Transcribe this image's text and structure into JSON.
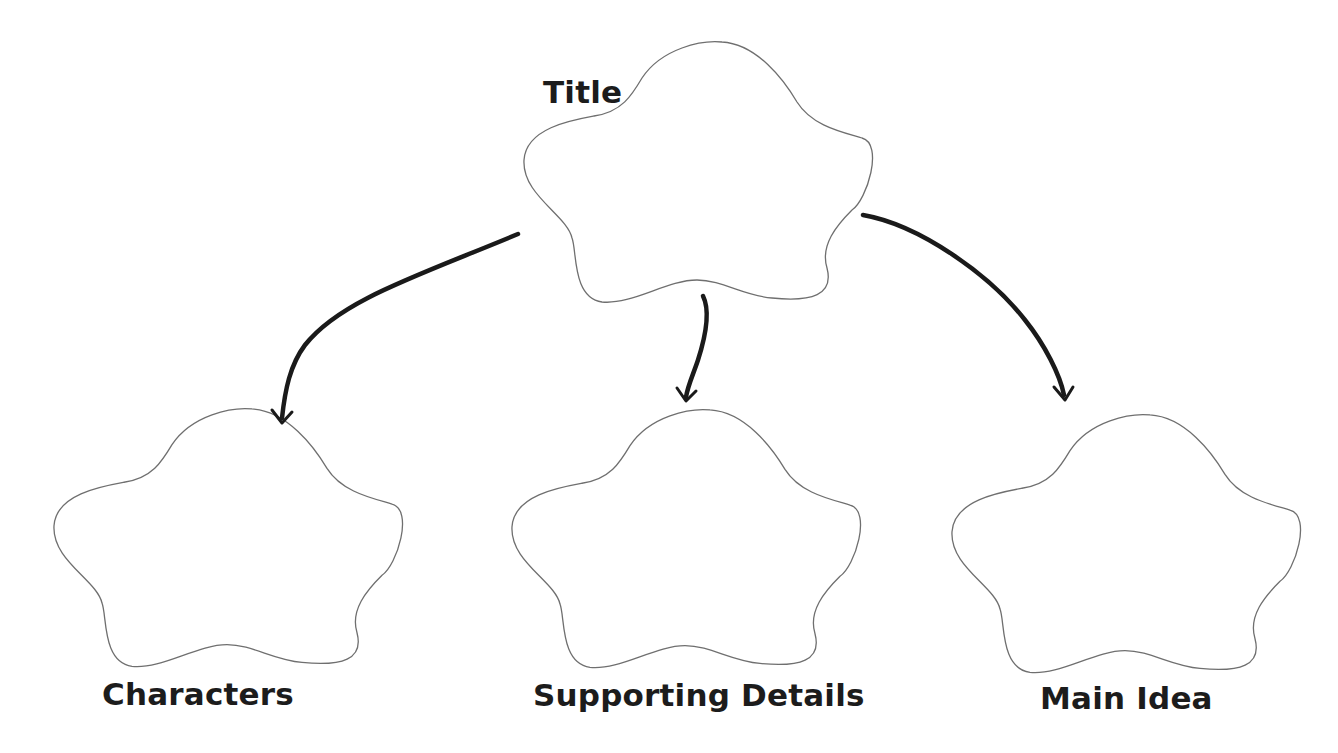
{
  "diagram": {
    "type": "graphic-organizer",
    "nodes": [
      {
        "id": "title",
        "label": "Title"
      },
      {
        "id": "characters",
        "label": "Characters"
      },
      {
        "id": "supporting",
        "label": "Supporting Details"
      },
      {
        "id": "main",
        "label": "Main Idea"
      }
    ],
    "edges": [
      {
        "from": "title",
        "to": "characters"
      },
      {
        "from": "title",
        "to": "supporting"
      },
      {
        "from": "title",
        "to": "main"
      }
    ],
    "colors": {
      "outline": "#6f6f6f",
      "arrow": "#1a1a1a",
      "text": "#1c1c1c",
      "background": "#ffffff"
    }
  }
}
